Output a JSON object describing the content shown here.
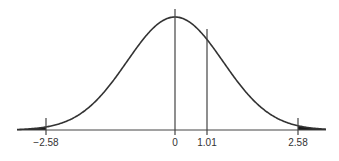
{
  "chart_data": {
    "type": "area",
    "title": "",
    "subtitle": "",
    "xlabel": "",
    "ylabel": "",
    "distribution": {
      "mean": 0,
      "sd": 1
    },
    "xlim": [
      -2.9,
      3.1
    ],
    "grid": false,
    "legend": null,
    "shaded_regions": [
      {
        "from": -3.3,
        "to": -2.58,
        "fill": "#1a1a1a"
      },
      {
        "from": 2.58,
        "to": 3.3,
        "fill": "#1a1a1a"
      }
    ],
    "reference_lines": [
      {
        "x": -2.58,
        "label": "−2.58"
      },
      {
        "x": 0,
        "label": "0"
      },
      {
        "x": 1.01,
        "label": "1.01"
      },
      {
        "x": 2.58,
        "label": "2.58"
      }
    ],
    "tick_labels": [
      "−2.58",
      "0",
      "1.01",
      "2.58"
    ]
  },
  "layout": {
    "center_px": 175,
    "sigma_px": 48,
    "baseline_px": 130,
    "peak_px": 17,
    "left_px": 17,
    "right_px": 326,
    "label_y_px": 146,
    "line_x_px": {
      "-2.58": 46,
      "0": 175,
      "1.01": 207,
      "2.58": 298
    },
    "line_top_px": {
      "0": 9
    }
  },
  "colors": {
    "curve": "#333333",
    "axis": "#444444",
    "tail": "#1a1a1a",
    "label": "#333333"
  }
}
